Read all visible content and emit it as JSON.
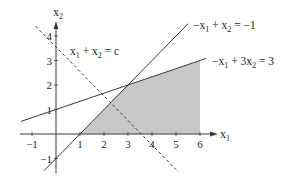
{
  "chart_data": {
    "type": "line",
    "title": "",
    "xlabel": "x1",
    "ylabel": "x2",
    "xlim": [
      -1.5,
      6.8
    ],
    "ylim": [
      -1.6,
      4.9
    ],
    "xticks": [
      -1,
      1,
      2,
      3,
      4,
      5,
      6
    ],
    "yticks": [
      -1,
      1,
      2,
      3,
      4
    ],
    "grid": false,
    "lines": [
      {
        "name": "constraint-1",
        "label": "−x1 + x2 = −1",
        "a": -1,
        "b": 1,
        "c": -1,
        "x_range": [
          -0.5,
          5.5
        ],
        "style": "solid"
      },
      {
        "name": "constraint-2",
        "label": "−x1 + 3x2 = 3",
        "a": -1,
        "b": 3,
        "c": 3,
        "x_range": [
          -1.45,
          6.25
        ],
        "style": "solid"
      },
      {
        "name": "objective",
        "label": "x1 + x2 = c",
        "a": 1,
        "b": 1,
        "c": 3.55,
        "x_range": [
          -0.85,
          5.1
        ],
        "style": "dashed"
      }
    ],
    "feasible_region": {
      "vertices": [
        [
          1,
          0
        ],
        [
          6,
          0
        ],
        [
          6,
          3
        ],
        [
          3,
          2
        ]
      ],
      "color": "#c8c8c8"
    }
  },
  "labels": {
    "x_axis": "x",
    "x_axis_sub": "1",
    "y_axis": "x",
    "y_axis_sub": "2",
    "eq1": {
      "parts": [
        "−x",
        "1",
        " + x",
        "2",
        " = −1"
      ]
    },
    "eq2": {
      "parts": [
        "−x",
        "1",
        " + 3x",
        "2",
        " = 3"
      ]
    },
    "eq3": {
      "parts": [
        "x",
        "1",
        " + x",
        "2",
        " = c"
      ]
    }
  },
  "colors": {
    "line": "#3a3a3a",
    "axis": "#3a3a3a",
    "shade": "#c8c8c8"
  }
}
